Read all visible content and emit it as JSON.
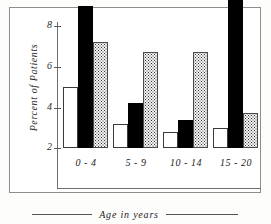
{
  "chart_data": {
    "type": "bar",
    "title": "",
    "xlabel": "Age in years",
    "ylabel": "Percent of Patients",
    "categories": [
      "0 - 4",
      "5 - 9",
      "10 - 14",
      "15 - 20"
    ],
    "ylim": [
      0,
      8.2
    ],
    "yticks": [
      2,
      4,
      6,
      8
    ],
    "ytick_labels": [
      "2",
      "4",
      "6",
      "8"
    ],
    "grid": false,
    "legend": "none",
    "series": [
      {
        "name": "open-bar",
        "fill": "white",
        "values": [
          3.0,
          1.2,
          0.8,
          1.0
        ]
      },
      {
        "name": "solid-bar",
        "fill": "black",
        "values": [
          7.0,
          2.2,
          1.4,
          8.0
        ]
      },
      {
        "name": "stippled-bar",
        "fill": "dotted",
        "values": [
          5.2,
          4.75,
          4.75,
          1.7
        ]
      }
    ]
  },
  "axis": {
    "y_title": "Percent of Patients",
    "x_title": "Age in years",
    "tick_2": "2",
    "tick_4": "4",
    "tick_6": "6",
    "tick_8": "8"
  },
  "xlabels": {
    "g0": "0 - 4",
    "g1": "5 - 9",
    "g2": "10 - 14",
    "g3": "15 - 20"
  },
  "colors": {
    "frame": "#8d8d8d",
    "axis": "#6e6e6e",
    "solid": "#000000",
    "open": "#ffffff",
    "dot": "#f4f4f4",
    "text": "#222222",
    "background": "#ffffff"
  }
}
